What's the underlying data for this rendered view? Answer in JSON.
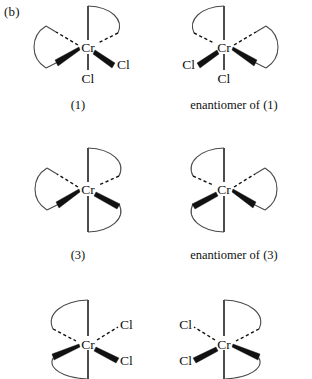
{
  "figure": {
    "part_label": "(b)",
    "domain_note": "octahedral chromium chelate complex stereochemistry diagram",
    "metal_symbol": "Cr",
    "ligand_symbol": "Cl",
    "colors": {
      "ink": "#111111",
      "arc": "#4a4a4a",
      "background": "#ffffff"
    }
  },
  "structures": [
    {
      "id": "structure-1",
      "caption": "(1)",
      "metal": "Cr",
      "chelate_rings": 2,
      "chloride_labels": [
        "Cl",
        "Cl"
      ],
      "chloride_positions": [
        "right",
        "bottom"
      ]
    },
    {
      "id": "structure-1-enantiomer",
      "caption": "enantiomer of (1)",
      "metal": "Cr",
      "chelate_rings": 2,
      "chloride_labels": [
        "Cl",
        "Cl"
      ],
      "chloride_positions": [
        "left",
        "bottom"
      ]
    },
    {
      "id": "structure-3",
      "caption": "(3)",
      "metal": "Cr",
      "chelate_rings": 3,
      "chloride_labels": [],
      "chloride_positions": []
    },
    {
      "id": "structure-3-enantiomer",
      "caption": "enantiomer of (3)",
      "metal": "Cr",
      "chelate_rings": 3,
      "chloride_labels": [],
      "chloride_positions": []
    },
    {
      "id": "structure-bottom-left",
      "caption": "",
      "metal": "Cr",
      "chelate_rings": 2,
      "chloride_labels": [
        "Cl",
        "Cl"
      ],
      "chloride_positions": [
        "upper-right",
        "lower-right"
      ]
    },
    {
      "id": "structure-bottom-right",
      "caption": "",
      "metal": "Cr",
      "chelate_rings": 2,
      "chloride_labels": [
        "Cl",
        "Cl"
      ],
      "chloride_positions": [
        "upper-left",
        "lower-left"
      ]
    }
  ]
}
